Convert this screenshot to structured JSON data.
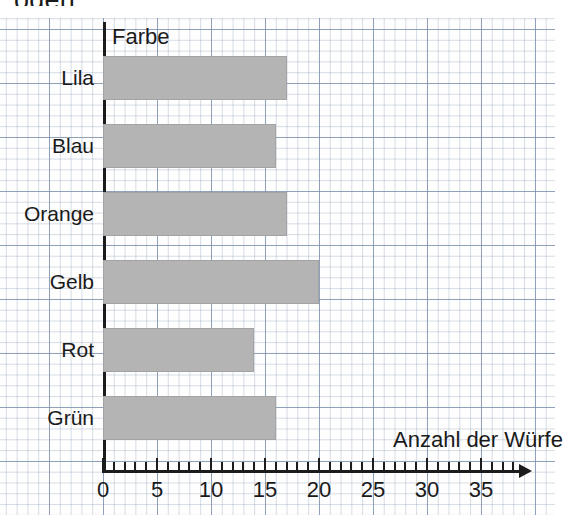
{
  "page": {
    "cut_off_text_above": "oden."
  },
  "chart_data": {
    "type": "bar",
    "orientation": "horizontal",
    "title": "",
    "xlabel": "Anzahl der Würfe",
    "ylabel": "Farbe",
    "categories": [
      "Lila",
      "Blau",
      "Orange",
      "Gelb",
      "Rot",
      "Grün"
    ],
    "values": [
      17,
      16,
      17,
      20,
      14,
      16
    ],
    "xlim": [
      0,
      38.5
    ],
    "xticks": [
      0,
      5,
      10,
      15,
      20,
      25,
      30,
      35
    ],
    "xtick_labels": [
      "0",
      "5",
      "10",
      "15",
      "20",
      "25",
      "30",
      "35"
    ],
    "minor_tick_step": 1,
    "grid": true,
    "grid_style": "graph-paper",
    "legend": "none",
    "bar_color": "#b4b4b4",
    "axis_color": "#1c1c1c",
    "grid_color": "#7f8caa"
  }
}
